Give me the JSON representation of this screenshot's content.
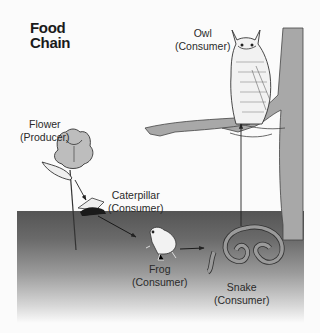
{
  "title": {
    "line1": "Food",
    "line2": "Chain"
  },
  "organisms": [
    {
      "name": "Flower",
      "role": "(Producer)"
    },
    {
      "name": "Caterpillar",
      "role": "(Consumer)"
    },
    {
      "name": "Frog",
      "role": "(Consumer)"
    },
    {
      "name": "Snake",
      "role": "(Consumer)"
    },
    {
      "name": "Owl",
      "role": "(Consumer)"
    }
  ],
  "arrows": [
    {
      "from": "Flower",
      "to": "Caterpillar"
    },
    {
      "from": "Caterpillar",
      "to": "Frog"
    },
    {
      "from": "Frog",
      "to": "Snake"
    },
    {
      "from": "Snake",
      "to": "Owl"
    }
  ],
  "colors": {
    "ground_top": "#555555",
    "background": "#fbfbfb",
    "tree": "#a8a8a8",
    "ink": "#222222"
  }
}
